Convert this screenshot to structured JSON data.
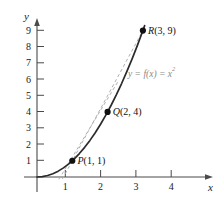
{
  "chart_data": {
    "type": "line",
    "title": "",
    "xlabel": "x",
    "ylabel": "y",
    "xlim": [
      -0.25,
      4.9
    ],
    "ylim": [
      -0.55,
      9.9
    ],
    "grid": false,
    "legend": false,
    "function_label": "y = f(x) = x",
    "function_exponent": "2",
    "x_ticks": [
      "1",
      "2",
      "3",
      "4"
    ],
    "x_tick_values": [
      1,
      2,
      3,
      4
    ],
    "y_ticks": [
      "1",
      "2",
      "3",
      "4",
      "5",
      "6",
      "7",
      "8",
      "9"
    ],
    "y_tick_values": [
      1,
      2,
      3,
      4,
      5,
      6,
      7,
      8,
      9
    ],
    "series": [
      {
        "name": "y = f(x) = x^2",
        "style": "solid",
        "color": "#2b2b2b",
        "x": [
          0,
          0.15,
          0.3,
          0.45,
          0.6,
          0.75,
          0.9,
          1.05,
          1.2,
          1.35,
          1.5,
          1.65,
          1.8,
          1.95,
          2.1,
          2.25,
          2.4,
          2.55,
          2.7,
          2.85,
          3,
          3.05
        ],
        "y": [
          0,
          0.0225,
          0.09,
          0.2025,
          0.36,
          0.5625,
          0.81,
          1.1025,
          1.44,
          1.8225,
          2.25,
          2.7225,
          3.24,
          3.8025,
          4.41,
          5.0625,
          5.76,
          6.5025,
          7.29,
          8.1225,
          9,
          9.3025
        ]
      },
      {
        "name": "secant PQ",
        "style": "dashed",
        "color": "#b0b0b0",
        "x": [
          0.62,
          2.32
        ],
        "y": [
          -0.14,
          5.96
        ]
      },
      {
        "name": "secant PR",
        "style": "dashed",
        "color": "#b0b0b0",
        "x": [
          0.72,
          3.06
        ],
        "y": [
          -0.12,
          9.24
        ]
      }
    ],
    "points": [
      {
        "id": "P",
        "name": "P",
        "x": 1,
        "y": 1,
        "label": "P(1, 1)",
        "label_position": "right"
      },
      {
        "id": "Q",
        "name": "Q",
        "x": 2,
        "y": 4,
        "label": "Q(2, 4)",
        "label_position": "right"
      },
      {
        "id": "R",
        "name": "R",
        "x": 3,
        "y": 9,
        "label": "R(3, 9)",
        "label_position": "right"
      }
    ],
    "point_labels": {
      "P": {
        "letter": "P",
        "coords": "(1, 1)"
      },
      "Q": {
        "letter": "Q",
        "coords": "(2, 4)"
      },
      "R": {
        "letter": "R",
        "coords": "(3, 9)"
      }
    }
  },
  "figure": {
    "axis_x_label": "x",
    "axis_y_label": "y",
    "axis_color": "#4a4a4a",
    "curve_color": "#2b2b2b",
    "secant_color": "#b0b0b0",
    "point_color": "#111111",
    "background": "#ffffff"
  }
}
